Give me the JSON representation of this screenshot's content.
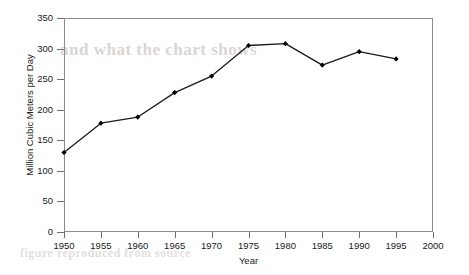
{
  "chart_data": {
    "type": "line",
    "title": "",
    "xlabel": "Year",
    "ylabel": "Million Cubic Meters per Day",
    "x": [
      1950,
      1955,
      1960,
      1965,
      1970,
      1975,
      1980,
      1985,
      1990,
      1995
    ],
    "values": [
      130,
      178,
      188,
      228,
      255,
      305,
      308,
      273,
      295,
      283
    ],
    "xlim": [
      1950,
      2000
    ],
    "ylim": [
      0,
      350
    ],
    "xticks": [
      1950,
      1955,
      1960,
      1965,
      1970,
      1975,
      1980,
      1985,
      1990,
      1995,
      2000
    ],
    "xtick_labels": [
      "1950",
      "1955",
      "1960",
      "1965",
      "1970",
      "1975",
      "1980",
      "1985",
      "1990",
      "1995",
      "2000"
    ],
    "yticks": [
      0,
      50,
      100,
      150,
      200,
      250,
      300,
      350
    ],
    "ytick_labels": [
      "0",
      "50",
      "100",
      "150",
      "200",
      "250",
      "300",
      "350"
    ],
    "grid": false,
    "legend": null,
    "series": [
      {
        "name": "Million Cubic Meters per Day",
        "line_color": "#1a1a1a",
        "marker": "diamond",
        "marker_color": "#000000",
        "values": [
          130,
          178,
          188,
          228,
          255,
          305,
          308,
          273,
          295,
          283
        ]
      }
    ]
  },
  "ghost_text": {
    "line1": "and what the chart shows",
    "line2": "figure reproduced from source"
  }
}
